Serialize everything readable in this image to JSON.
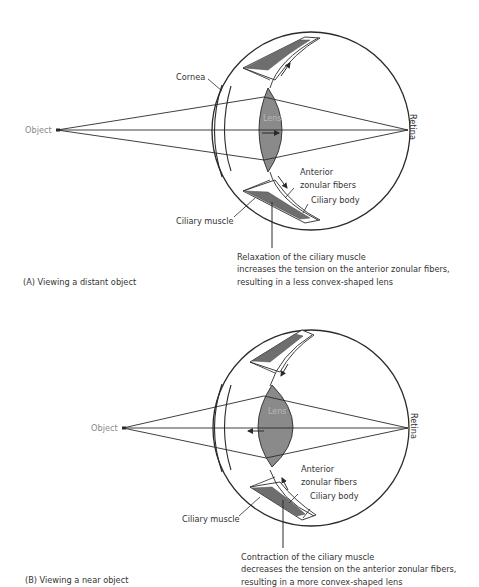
{
  "panels": [
    {
      "id": "A",
      "caption": "(A) Viewing a distant object",
      "labels": {
        "object": "Object",
        "cornea": "Cornea",
        "lens": "Lens",
        "retina": "Retina",
        "anterior_line1": "Anterior",
        "anterior_line2": "zonular fibers",
        "ciliary_body": "Ciliary body",
        "ciliary_muscle": "Ciliary muscle"
      },
      "note": [
        "Relaxation of the ciliary muscle",
        "increases the tension on the anterior zonular fibers,",
        "resulting in a less convex-shaped lens"
      ]
    },
    {
      "id": "B",
      "caption": "(B) Viewing a near object",
      "labels": {
        "object": "Object",
        "lens": "Lens",
        "retina": "Retina",
        "anterior_line1": "Anterior",
        "anterior_line2": "zonular fibers",
        "ciliary_body": "Ciliary body",
        "ciliary_muscle": "Ciliary muscle"
      },
      "note": [
        "Contraction of the ciliary muscle",
        "decreases the tension on the anterior zonular fibers,",
        "resulting in a more convex-shaped lens"
      ]
    }
  ],
  "colors": {
    "line": "#2a2a2a",
    "lens_fill": "#8a8a8a",
    "muscle_fill": "#6e6e6e",
    "text": "#333333",
    "grey_text": "#888888"
  }
}
